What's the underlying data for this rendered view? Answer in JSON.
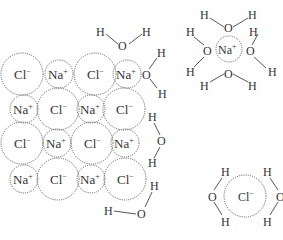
{
  "diagram": {
    "labels": {
      "chloride": "Cl",
      "chloride_charge": "−",
      "sodium": "Na",
      "sodium_charge": "+",
      "oxygen": "O",
      "hydrogen": "H"
    },
    "lattice": {
      "rows": [
        [
          "Cl",
          "Na",
          "Cl",
          "Na"
        ],
        [
          "Na",
          "Cl",
          "Na",
          "Cl"
        ],
        [
          "Cl",
          "Na",
          "Cl",
          "Na"
        ],
        [
          "Na",
          "Cl",
          "Na",
          "Cl"
        ]
      ]
    },
    "hydrated_ions": [
      {
        "ion": "Na",
        "charge": "+",
        "water_count": 4
      },
      {
        "ion": "Cl",
        "charge": "−",
        "water_count": 2
      }
    ],
    "free_waters_near_lattice": 4
  }
}
